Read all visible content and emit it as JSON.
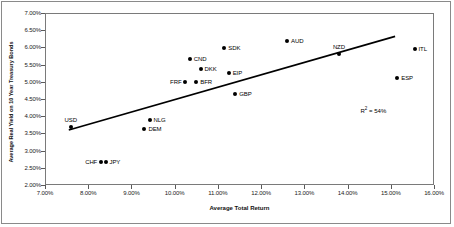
{
  "chart_data": {
    "type": "scatter",
    "title": "",
    "xlabel": "Average Total Return",
    "ylabel": "Average Real Yield on 10 Year Treasury Bonds",
    "xlim": [
      7.0,
      16.0
    ],
    "ylim": [
      2.0,
      7.0
    ],
    "xticks": [
      "7.00%",
      "8.00%",
      "9.00%",
      "10.00%",
      "11.00%",
      "12.00%",
      "13.00%",
      "14.00%",
      "15.00%",
      "16.00%"
    ],
    "xtick_values": [
      7.0,
      8.0,
      9.0,
      10.0,
      11.0,
      12.0,
      13.0,
      14.0,
      15.0,
      16.0
    ],
    "yticks": [
      "7.00%",
      "6.50%",
      "6.00%",
      "5.50%",
      "5.00%",
      "4.50%",
      "4.00%",
      "3.50%",
      "3.00%",
      "2.50%",
      "2.00%"
    ],
    "ytick_values": [
      7.0,
      6.5,
      6.0,
      5.5,
      5.0,
      4.5,
      4.0,
      3.5,
      3.0,
      2.5,
      2.0
    ],
    "grid": false,
    "legend": false,
    "points": [
      {
        "label": "USD",
        "x": 7.6,
        "y": 3.7,
        "label_pos": "above"
      },
      {
        "label": "CHF",
        "x": 8.3,
        "y": 2.68,
        "label_pos": "left"
      },
      {
        "label": "JPY",
        "x": 8.4,
        "y": 2.66,
        "label_pos": "right"
      },
      {
        "label": "DEM",
        "x": 9.3,
        "y": 3.63,
        "label_pos": "right"
      },
      {
        "label": "NLG",
        "x": 9.42,
        "y": 3.9,
        "label_pos": "right"
      },
      {
        "label": "FRF",
        "x": 10.25,
        "y": 5.0,
        "label_pos": "left"
      },
      {
        "label": "BFR",
        "x": 10.5,
        "y": 5.0,
        "label_pos": "right"
      },
      {
        "label": "CND",
        "x": 10.35,
        "y": 5.65,
        "label_pos": "right"
      },
      {
        "label": "DKK",
        "x": 10.6,
        "y": 5.37,
        "label_pos": "right"
      },
      {
        "label": "SDK",
        "x": 11.15,
        "y": 5.98,
        "label_pos": "right"
      },
      {
        "label": "EIP",
        "x": 11.25,
        "y": 5.25,
        "label_pos": "right"
      },
      {
        "label": "GBP",
        "x": 11.4,
        "y": 4.65,
        "label_pos": "right"
      },
      {
        "label": "AUD",
        "x": 12.6,
        "y": 6.18,
        "label_pos": "right"
      },
      {
        "label": "NZD",
        "x": 13.8,
        "y": 5.82,
        "label_pos": "above"
      },
      {
        "label": "ESP",
        "x": 15.15,
        "y": 5.1,
        "label_pos": "right"
      },
      {
        "label": "ITL",
        "x": 15.55,
        "y": 5.95,
        "label_pos": "right"
      }
    ],
    "trendline": {
      "x0": 7.55,
      "y0": 3.6,
      "x1": 15.1,
      "y1": 6.32
    },
    "annotations": [
      {
        "name": "r-squared",
        "text_prefix": "R",
        "text_sup": "2",
        "text_suffix": " = 54%",
        "x": 14.3,
        "y": 4.3
      }
    ]
  }
}
